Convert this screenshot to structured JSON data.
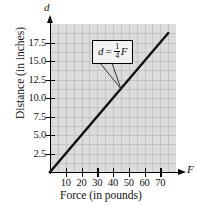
{
  "chart_data": {
    "type": "line",
    "title": "",
    "xlabel": "Force (in pounds)",
    "ylabel": "Distance (in inches)",
    "x_axis_symbol": "F",
    "y_axis_symbol": "d",
    "xlim": [
      0,
      80
    ],
    "ylim": [
      0,
      20
    ],
    "xticks": [
      10,
      20,
      30,
      40,
      50,
      60,
      70
    ],
    "xtick_labels": [
      "10",
      "20",
      "30",
      "40",
      "50",
      "60",
      "70"
    ],
    "yticks": [
      2.5,
      5.0,
      7.5,
      10.0,
      12.5,
      15.0,
      17.5
    ],
    "ytick_labels": [
      "2.5",
      "5.0",
      "7.5",
      "10.0",
      "12.5",
      "15.0",
      "17.5"
    ],
    "grid": true,
    "legend": "none",
    "series": [
      {
        "name": "d = 1/4 F",
        "slope": 0.25,
        "intercept": 0,
        "x": [
          0,
          75
        ],
        "values": [
          0,
          18.75
        ]
      }
    ],
    "annotations": [
      {
        "type": "callout",
        "text": "d = 1/4 F",
        "equation_lhs": "d",
        "equation_eq": "=",
        "equation_numerator": "1",
        "equation_denominator": "4",
        "equation_rhs": "F",
        "points_to_x": 45,
        "points_to_y": 11.25
      }
    ]
  },
  "colors": {
    "plot_background": "#dcdcdc",
    "grid_line": "#c4c4c4",
    "axis": "#000000",
    "data_line": "#111111",
    "callout_background": "#f2f2f2",
    "page_background": "#ffffff"
  }
}
